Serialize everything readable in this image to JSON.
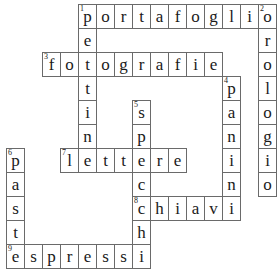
{
  "grid": {
    "cols": 15,
    "rows": 11,
    "origin_x": 6,
    "origin_y": 4,
    "cell_w": 18,
    "cell_h": 24,
    "border_color": "#6a6a6a",
    "text_color": "#1a1a1a"
  },
  "words": [
    {
      "number": "1",
      "direction": "across",
      "answer": "portafoglio",
      "row": 0,
      "col": 4
    },
    {
      "number": "1",
      "direction": "down",
      "answer": "pettine",
      "row": 0,
      "col": 4
    },
    {
      "number": "2",
      "direction": "down",
      "answer": "orologio",
      "row": 0,
      "col": 14
    },
    {
      "number": "3",
      "direction": "across",
      "answer": "fotografie",
      "row": 2,
      "col": 2
    },
    {
      "number": "4",
      "direction": "down",
      "answer": "panini",
      "row": 3,
      "col": 12
    },
    {
      "number": "5",
      "direction": "down",
      "answer": "specchi",
      "row": 4,
      "col": 7
    },
    {
      "number": "6",
      "direction": "down",
      "answer": "paste",
      "row": 6,
      "col": 0
    },
    {
      "number": "7",
      "direction": "across",
      "answer": "lettere",
      "row": 6,
      "col": 3
    },
    {
      "number": "8",
      "direction": "across",
      "answer": "chiavi",
      "row": 8,
      "col": 7
    },
    {
      "number": "9",
      "direction": "across",
      "answer": "espressi",
      "row": 10,
      "col": 0
    }
  ]
}
